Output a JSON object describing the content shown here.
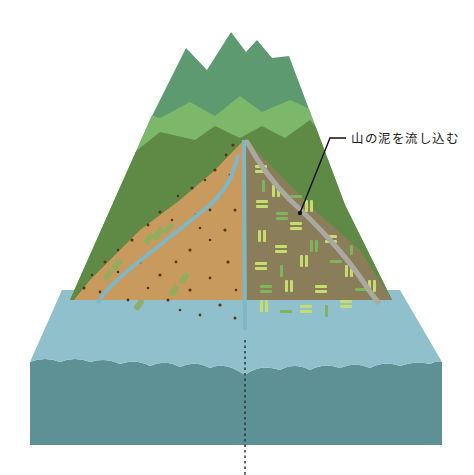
{
  "diagram": {
    "title": "山の泥を流し込む",
    "annotation": {
      "text": "山の泥を流し込む",
      "target": "mountain-road"
    },
    "layers": [
      {
        "name": "far-peaks",
        "color": "#5e9a70"
      },
      {
        "name": "mid-ridge",
        "color": "#7db86a"
      },
      {
        "name": "near-ridge",
        "color": "#5f8a45"
      },
      {
        "name": "left-slope-soil",
        "color": "#c89a5e"
      },
      {
        "name": "right-slope-terraced-fields",
        "color": "#8a7e5a"
      },
      {
        "name": "river-channel",
        "color": "#7fb7c4"
      },
      {
        "name": "sea-surface",
        "color": "#8fc0cc"
      },
      {
        "name": "sea-depth",
        "color": "#5e9196"
      }
    ],
    "colors": {
      "field_light": "#c6dc6e",
      "field_dark": "#7fb45a",
      "road": "#a9a9a0",
      "dots": "#5a3418",
      "leader_line": "#111111"
    }
  }
}
